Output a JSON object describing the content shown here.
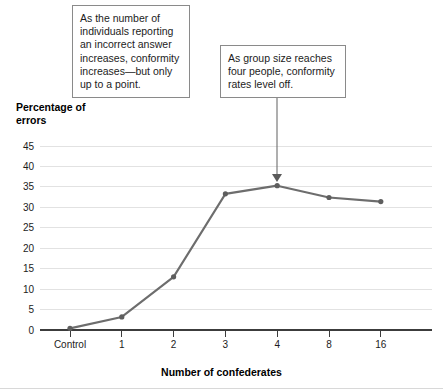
{
  "chart_data": {
    "type": "line",
    "title": "",
    "xlabel": "Number of confederates",
    "ylabel": "Percentage of errors",
    "categories": [
      "Control",
      "1",
      "2",
      "3",
      "4",
      "8",
      "16"
    ],
    "values": [
      0.4,
      3.2,
      13.0,
      33.3,
      35.3,
      32.4,
      31.4
    ],
    "series": [
      {
        "name": "Percentage of errors",
        "values": [
          0.4,
          3.2,
          13.0,
          33.3,
          35.3,
          32.4,
          31.4
        ]
      }
    ],
    "ylim": [
      0,
      45
    ],
    "yticks": [
      0,
      5,
      10,
      15,
      20,
      25,
      30,
      35,
      40,
      45
    ],
    "ytick_labels": [
      "0",
      "5",
      "10",
      "15",
      "20",
      "25",
      "30",
      "35",
      "40",
      "45"
    ],
    "grid": true,
    "legend": "none",
    "annotations": [
      "As the number of individuals reporting an incorrect answer increases, conformity increases—but only up to a point.",
      "As group size reaches four people, conformity rates level off."
    ]
  },
  "axes": {
    "y_title": "Percentage of\nerrors",
    "x_title": "Number of confederates"
  },
  "callouts": {
    "increase": "As the number of\nindividuals reporting\nan incorrect answer\nincreases, conformity\nincreases—but only\nup to a point.",
    "level_off": "As group size reaches\nfour people, conformity\nrates level off."
  },
  "colors": {
    "line": "#6d6d6d",
    "point": "#5e5e5e",
    "grid": "#e2e2e2",
    "axis": "#3c3c3c",
    "callout_border": "#8a8a8a",
    "text": "#1c1c1c",
    "background": "#ffffff"
  }
}
